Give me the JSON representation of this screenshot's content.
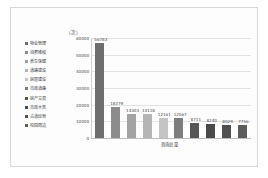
{
  "chart_data": {
    "type": "bar",
    "title": "",
    "xlabel": "咨询总量",
    "ylabel": "（次）",
    "ylim": [
      0,
      60000
    ],
    "ytick_step": 10000,
    "yticks": [
      "60000",
      "50000",
      "40000",
      "30000",
      "20000",
      "10000",
      "0"
    ],
    "grid": true,
    "legend_position": "left",
    "categories": [
      "物业管理",
      "消费维权",
      "养生保健",
      "道路建设",
      "房屋建设",
      "市政道路",
      "房产交易",
      "市政水务",
      "占道经营",
      "校园周边"
    ],
    "values": [
      56783,
      18379,
      14303,
      14118,
      12161,
      12067,
      8711,
      8240,
      8029,
      7756
    ],
    "value_labels": [
      "56783",
      "18379",
      "14303",
      "14118",
      "12161",
      "12067",
      "8711",
      "8240",
      "8029",
      "7756"
    ],
    "bar_colors": [
      "#6e6e6e",
      "#8c8c8c",
      "#a3a3a3",
      "#b5b5b5",
      "#c4c4c4",
      "#7d7d7d",
      "#565656",
      "#4a4a4a",
      "#515151",
      "#5c5c5c"
    ]
  },
  "legend": {
    "items": [
      {
        "label": "物业管理",
        "color": "#6e6e6e"
      },
      {
        "label": "消费维权",
        "color": "#8c8c8c"
      },
      {
        "label": "养生保健",
        "color": "#a3a3a3"
      },
      {
        "label": "道路建设",
        "color": "#b5b5b5"
      },
      {
        "label": "房屋建设",
        "color": "#c4c4c4"
      },
      {
        "label": "市政道路",
        "color": "#7d7d7d"
      },
      {
        "label": "房产交易",
        "color": "#565656"
      },
      {
        "label": "市政水务",
        "color": "#4a4a4a"
      },
      {
        "label": "占道经营",
        "color": "#515151"
      },
      {
        "label": "校园周边",
        "color": "#5c5c5c"
      }
    ]
  }
}
